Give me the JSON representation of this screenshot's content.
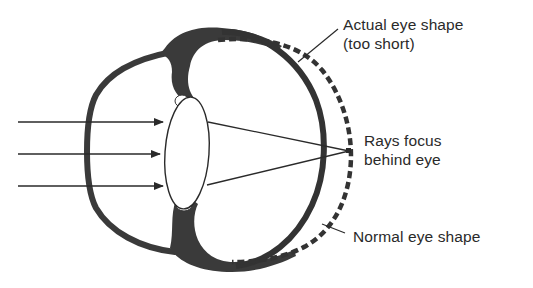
{
  "figure": {
    "labels": {
      "actual_shape_line1": "Actual eye shape",
      "actual_shape_line2": "(too short)",
      "focus_line1": "Rays focus",
      "focus_line2": "behind eye",
      "normal_shape": "Normal eye shape"
    },
    "incoming_rays": 3,
    "colors": {
      "ink": "#2a2a2a",
      "tissue": "#3a3a3a",
      "background": "#ffffff"
    }
  }
}
